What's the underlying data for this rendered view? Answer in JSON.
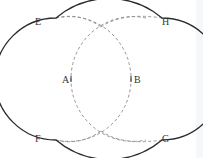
{
  "diagram": {
    "type": "geometric construction",
    "colors": {
      "outline": "#2a2a2a",
      "dashed": "#8a8a8a",
      "labels": "#333333",
      "background": "#ffffff"
    },
    "points": [
      {
        "id": "E",
        "label": "E"
      },
      {
        "id": "H",
        "label": "H"
      },
      {
        "id": "A",
        "label": "A"
      },
      {
        "id": "B",
        "label": "B"
      },
      {
        "id": "F",
        "label": "F"
      },
      {
        "id": "G",
        "label": "G"
      }
    ]
  }
}
